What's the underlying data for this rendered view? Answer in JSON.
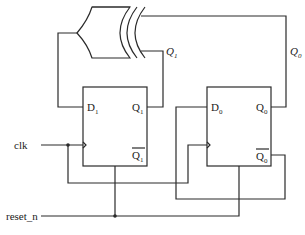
{
  "diagram": {
    "type": "circuit",
    "signals": {
      "clk": "clk",
      "reset": "reset_n",
      "q1_wire": "Q",
      "q1_wire_sub": "1",
      "q0_wire": "Q",
      "q0_wire_sub": "0"
    },
    "flipflops": [
      {
        "name": "FF1",
        "d_label": "D",
        "d_sub": "1",
        "q_label": "Q",
        "q_sub": "1",
        "qbar_label": "Q",
        "qbar_sub": "1"
      },
      {
        "name": "FF0",
        "d_label": "D",
        "d_sub": "0",
        "q_label": "Q",
        "q_sub": "0",
        "qbar_label": "Q",
        "qbar_sub": "0"
      }
    ],
    "gates": [
      {
        "type": "XOR",
        "inputs": [
          "Q0",
          "Q1"
        ],
        "output": "D1"
      }
    ],
    "colors": {
      "line": "#2a2a2a",
      "background": "#ffffff"
    }
  }
}
